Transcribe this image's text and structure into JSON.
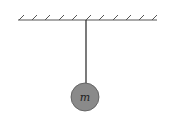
{
  "diagram": {
    "type": "pendulum",
    "ceiling": {
      "x1": 18,
      "x2": 157,
      "y": 20,
      "hatch_count": 11,
      "color": "#555555"
    },
    "string": {
      "x": 86,
      "y1": 20,
      "y2": 83,
      "color": "#333333"
    },
    "bob": {
      "cx": 85,
      "cy": 97,
      "r": 14,
      "fill": "#8a8a8a",
      "stroke": "#555555",
      "label": "m"
    }
  }
}
